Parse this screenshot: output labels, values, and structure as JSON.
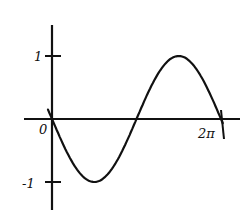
{
  "chart_data": {
    "type": "line",
    "title": "",
    "xlabel": "",
    "ylabel": "",
    "function": "y = -sin(x)",
    "x_ticks": [
      {
        "value": 0,
        "label": "0"
      },
      {
        "value": 6.2832,
        "label": "2π"
      }
    ],
    "y_ticks": [
      {
        "value": 1,
        "label": "1"
      },
      {
        "value": -1,
        "label": "-1"
      }
    ],
    "xlim": [
      -0.3,
      6.9
    ],
    "ylim": [
      -1.6,
      1.6
    ],
    "grid": false,
    "legend": null,
    "series": [
      {
        "name": "curve",
        "x": [
          -0.15,
          0,
          0.7854,
          1.5708,
          2.3562,
          3.1416,
          3.927,
          4.7124,
          5.4978,
          6.2832,
          6.35
        ],
        "values": [
          0.15,
          0,
          -0.707,
          -1,
          -0.707,
          0,
          0.707,
          1,
          0.707,
          0,
          -0.07
        ]
      }
    ]
  },
  "labels": {
    "origin": "0",
    "y_pos": "1",
    "y_neg": "-1",
    "x_end": "2π"
  }
}
